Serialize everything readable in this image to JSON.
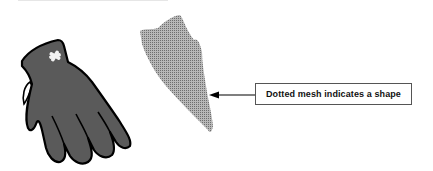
{
  "diagram": {
    "callout": {
      "label": "Dotted mesh indicates a shape"
    },
    "elements": [
      {
        "name": "glove",
        "fill": "#5a5a5a",
        "outline": "#000000",
        "mark": "white-x"
      },
      {
        "name": "dotted-mesh-shape",
        "fill": "#9a9a9a",
        "pattern": "dotted"
      }
    ],
    "colors": {
      "glove_fill": "#5a5a5a",
      "mesh_fill": "#a0a0a0",
      "outline": "#000000",
      "background": "#ffffff"
    }
  }
}
